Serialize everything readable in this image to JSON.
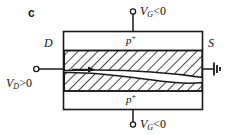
{
  "figure": {
    "panel_label": "c",
    "type": "jfet-cross-section",
    "device": {
      "drain_label": "D",
      "source_label": "S",
      "top_gate_region_label": "p",
      "top_gate_region_sup": "+",
      "bottom_gate_region_label": "p",
      "bottom_gate_region_sup": "+"
    },
    "terminals": {
      "top_gate": {
        "symbol": "V",
        "sub": "G",
        "relation": "<0",
        "name": "top-gate-voltage"
      },
      "bottom_gate": {
        "symbol": "V",
        "sub": "G",
        "relation": "<0",
        "name": "bottom-gate-voltage"
      },
      "drain": {
        "symbol": "V",
        "sub": "D",
        "relation": ">0",
        "name": "drain-voltage"
      },
      "source": {
        "label": "",
        "name": "source-ground"
      }
    },
    "colors": {
      "stroke": "#1a1a1a",
      "background": "#ffffff",
      "hatch": "#1a1a1a"
    }
  }
}
